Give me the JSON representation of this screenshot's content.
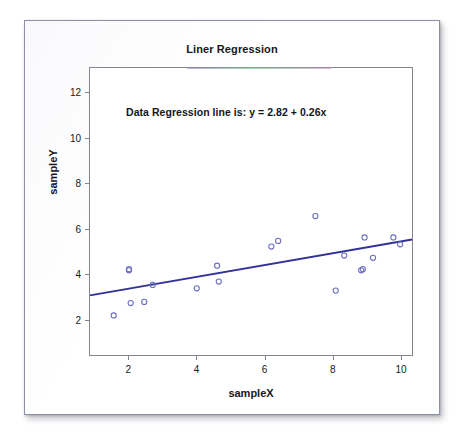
{
  "chart_data": {
    "type": "scatter",
    "title": "Liner Regression",
    "xlabel": "sampleX",
    "ylabel": "sampleY",
    "annotation": "Data Regression line is: y = 2.82 + 0.26x",
    "grid": false,
    "legend": "none",
    "xlim": [
      0.85,
      10.35
    ],
    "ylim": [
      0.4,
      13.1
    ],
    "xticks": [
      "2",
      "4",
      "6",
      "8",
      "10"
    ],
    "xtick_values": [
      2,
      4,
      6,
      8,
      10
    ],
    "yticks": [
      "2",
      "4",
      "6",
      "8",
      "10",
      "12"
    ],
    "ytick_values": [
      2,
      4,
      6,
      8,
      10,
      12
    ],
    "point_color": "#6b6fbe",
    "line_color": "#31319a",
    "marker": "open-circle",
    "fit": {
      "intercept": 2.82,
      "slope": 0.26,
      "x_start": 0.85,
      "x_end": 10.35
    },
    "x": [
      1.55,
      2.0,
      2.0,
      2.05,
      2.45,
      2.7,
      4.0,
      4.6,
      4.65,
      6.2,
      6.4,
      7.5,
      8.1,
      8.35,
      8.85,
      8.9,
      8.95,
      9.2,
      9.8,
      10.0
    ],
    "y": [
      2.15,
      4.15,
      4.2,
      2.7,
      2.75,
      3.5,
      3.35,
      4.35,
      3.65,
      5.2,
      5.45,
      6.55,
      3.25,
      4.8,
      4.15,
      4.2,
      5.6,
      4.7,
      5.6,
      5.3
    ],
    "points": [
      {
        "x": 1.55,
        "y": 2.15
      },
      {
        "x": 2.0,
        "y": 4.15
      },
      {
        "x": 2.0,
        "y": 4.2
      },
      {
        "x": 2.05,
        "y": 2.7
      },
      {
        "x": 2.45,
        "y": 2.75
      },
      {
        "x": 2.7,
        "y": 3.5
      },
      {
        "x": 4.0,
        "y": 3.35
      },
      {
        "x": 4.6,
        "y": 4.35
      },
      {
        "x": 4.65,
        "y": 3.65
      },
      {
        "x": 6.2,
        "y": 5.2
      },
      {
        "x": 6.4,
        "y": 5.45
      },
      {
        "x": 7.5,
        "y": 6.55
      },
      {
        "x": 8.1,
        "y": 3.25
      },
      {
        "x": 8.35,
        "y": 4.8
      },
      {
        "x": 8.85,
        "y": 4.15
      },
      {
        "x": 8.9,
        "y": 4.2
      },
      {
        "x": 8.95,
        "y": 5.6
      },
      {
        "x": 9.2,
        "y": 4.7
      },
      {
        "x": 9.8,
        "y": 5.6
      },
      {
        "x": 10.0,
        "y": 5.3
      }
    ]
  }
}
